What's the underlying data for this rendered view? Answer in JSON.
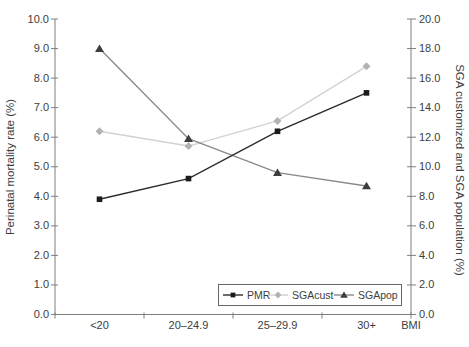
{
  "chart_data": {
    "type": "line",
    "categories": [
      "<20",
      "20–24.9",
      "25–29.9",
      "30+"
    ],
    "series": [
      {
        "name": "PMR",
        "axis": "left",
        "marker": "square",
        "marker_color": "#1c1c1c",
        "line_color": "#2b2b2b",
        "values": [
          3.9,
          4.6,
          6.2,
          7.5
        ]
      },
      {
        "name": "SGAcust",
        "axis": "right",
        "marker": "diamond",
        "marker_color": "#b3b3b3",
        "line_color": "#d2d2d2",
        "values": [
          12.4,
          11.4,
          13.1,
          16.8
        ]
      },
      {
        "name": "SGApop",
        "axis": "right",
        "marker": "triangle",
        "marker_color": "#3d3d3d",
        "line_color": "#8a8a8a",
        "values": [
          18.0,
          11.9,
          9.6,
          8.7
        ]
      }
    ],
    "left_axis": {
      "title": "Perinatal mortality rate (%)",
      "min": 0,
      "max": 10,
      "step": 1
    },
    "right_axis": {
      "title": "SGA customized and SGA population (%)",
      "min": 0,
      "max": 20,
      "step": 2
    },
    "x_axis_title": "BMI",
    "legend": {
      "entries": [
        "PMR",
        "SGAcust",
        "SGApop"
      ],
      "position": "bottom-right-inside"
    },
    "grid": false,
    "colors": {
      "axis_line": "#7f7f7f",
      "text": "#3d3d3d",
      "legend_border": "#666666",
      "background": "#ffffff"
    }
  }
}
